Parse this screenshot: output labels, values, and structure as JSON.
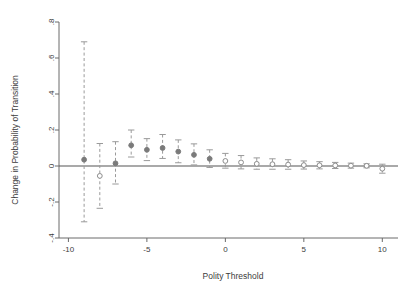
{
  "chart_data": {
    "type": "scatter",
    "title": "",
    "xlabel": "Polity Threshold",
    "ylabel": "Change in Probability of Transition",
    "xlim": [
      -10.6,
      11.0
    ],
    "ylim": [
      -0.4,
      0.8
    ],
    "xticks": [
      -10,
      -5,
      0,
      5,
      10
    ],
    "xtick_labels": [
      "-10",
      "-5",
      "0",
      "5",
      "10"
    ],
    "yticks": [
      -0.4,
      -0.2,
      0,
      0.2,
      0.4,
      0.6,
      0.8
    ],
    "ytick_labels": [
      "-.4",
      "-.2",
      "0",
      ".2",
      ".4",
      ".6",
      ".8"
    ],
    "grid": false,
    "legend": "none",
    "zero_line": 0,
    "marker_colors": {
      "filled": "#7a7a7a",
      "hollow_edge": "#8c8c8c",
      "hollow_face": "#ffffff"
    },
    "errorbar_color": "#9a9a9a",
    "errorbar_style": "dashed",
    "x": [
      -9,
      -8,
      -7,
      -6,
      -5,
      -4,
      -3,
      -2,
      -1,
      0,
      1,
      2,
      3,
      4,
      5,
      6,
      7,
      8,
      9,
      10
    ],
    "estimate": [
      0.035,
      -0.055,
      0.015,
      0.115,
      0.09,
      0.1,
      0.08,
      0.062,
      0.04,
      0.028,
      0.02,
      0.012,
      0.01,
      0.008,
      0.005,
      0.004,
      0.003,
      0.002,
      0.001,
      -0.015
    ],
    "ci_low": [
      -0.31,
      -0.235,
      -0.1,
      0.05,
      0.03,
      0.042,
      0.018,
      0.006,
      -0.008,
      -0.012,
      -0.016,
      -0.018,
      -0.018,
      -0.018,
      -0.017,
      -0.016,
      -0.014,
      -0.012,
      -0.01,
      -0.04
    ],
    "ci_high": [
      0.69,
      0.125,
      0.135,
      0.2,
      0.152,
      0.175,
      0.145,
      0.123,
      0.09,
      0.07,
      0.058,
      0.045,
      0.04,
      0.035,
      0.028,
      0.024,
      0.02,
      0.016,
      0.012,
      0.01
    ],
    "marker_fill": [
      "filled",
      "hollow",
      "filled",
      "filled",
      "filled",
      "filled",
      "filled",
      "filled",
      "filled",
      "hollow",
      "hollow",
      "hollow",
      "hollow",
      "hollow",
      "hollow",
      "hollow",
      "hollow",
      "hollow",
      "hollow",
      "hollow"
    ],
    "series_name": "Change in Probability of Transition"
  }
}
